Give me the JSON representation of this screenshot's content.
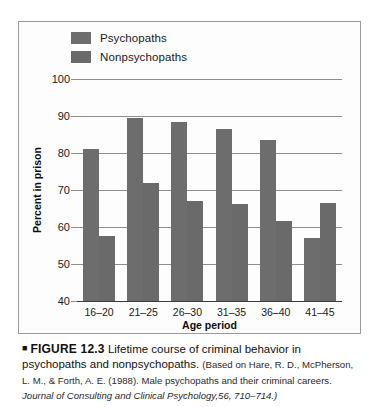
{
  "legend": {
    "items": [
      {
        "label": "Psychopaths",
        "color": "#6d6d6d",
        "swatch_icon": "legend-swatch-icon"
      },
      {
        "label": "Nonpsychopaths",
        "color": "#6a6a6a",
        "swatch_icon": "legend-swatch-icon"
      }
    ]
  },
  "caption": {
    "marker": "■",
    "figure_number": "FIGURE 12.3",
    "title": "Lifetime course of criminal behavior in psychopaths and nonpsychopaths.",
    "source_prefix": "(Based on Hare, R. D., McPherson, L. M., & Forth, A. E. (1988). Male psychopaths and their criminal careers.",
    "journal": "Journal of Consulting and Clinical Psychology,",
    "volume_pages": "56, 710–714.)"
  },
  "chart_data": {
    "type": "bar",
    "title": "",
    "xlabel": "Age period",
    "ylabel": "Percent in prison",
    "categories": [
      "16–20",
      "21–25",
      "26–30",
      "31–35",
      "36–40",
      "41–45"
    ],
    "series": [
      {
        "name": "Psychopaths",
        "color": "#6d6d6d",
        "values": [
          81,
          89.5,
          88.3,
          86.5,
          83.5,
          57
        ]
      },
      {
        "name": "Nonpsychopaths",
        "color": "#6a6a6a",
        "values": [
          57.5,
          71.8,
          67,
          66.3,
          61.5,
          66.5
        ]
      }
    ],
    "ylim": [
      40,
      100
    ],
    "yticks": [
      40,
      50,
      60,
      70,
      80,
      90,
      100
    ],
    "ytick_labels": [
      "40",
      "50",
      "60",
      "70",
      "80",
      "90",
      "100"
    ],
    "grid": true,
    "legend_position": "top-left"
  }
}
